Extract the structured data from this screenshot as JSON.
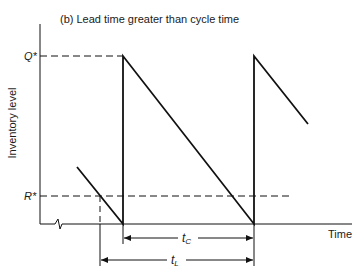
{
  "title": "(b)   Lead time greater than cycle time",
  "axes": {
    "y_label": "Inventory level",
    "x_label": "Time"
  },
  "levels": {
    "q_star": "Q*",
    "r_star": "R*"
  },
  "intervals": {
    "cycle_time": "t",
    "cycle_time_sub": "C",
    "lead_time": "t",
    "lead_time_sub": "L"
  },
  "colors": {
    "line": "#111111",
    "background": "#ffffff"
  }
}
